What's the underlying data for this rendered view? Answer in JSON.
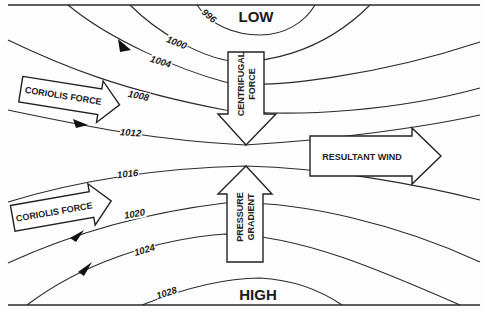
{
  "title_low": "LOW",
  "title_high": "HIGH",
  "isobars": [
    {
      "value": "996"
    },
    {
      "value": "1000"
    },
    {
      "value": "1004"
    },
    {
      "value": "1008"
    },
    {
      "value": "1012"
    },
    {
      "value": "1016"
    },
    {
      "value": "1020"
    },
    {
      "value": "1024"
    },
    {
      "value": "1028"
    }
  ],
  "forces": {
    "coriolis_upper": "CORIOLIS FORCE",
    "coriolis_lower": "CORIOLIS FORCE",
    "centrifugal_line1": "CENTRIFUGAL",
    "centrifugal_line2": "FORCE",
    "pressure_line1": "PRESSURE",
    "pressure_line2": "GRADIENT",
    "resultant": "RESULTANT WIND"
  },
  "colors": {
    "line": "#2a2a2a",
    "background": "#fdfdfd",
    "arrow_fill": "#ffffff"
  }
}
